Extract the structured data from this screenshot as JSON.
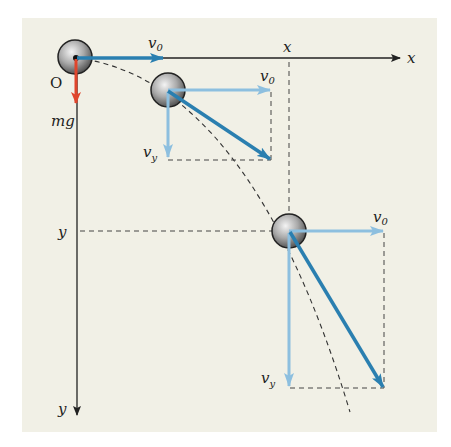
{
  "figure": {
    "type": "projectile-motion-diagram",
    "background_color": "#f1f0e6",
    "colors": {
      "velocity_dark": "#2a7fb0",
      "velocity_light": "#8dbfdf",
      "gravity": "#e0452c",
      "axis": "#222222",
      "trajectory": "#333333"
    },
    "labels": {
      "origin": "O",
      "x_axis": "x",
      "y_axis": "y",
      "x_marker": "x",
      "y_marker": "y",
      "gravity": "mg",
      "v0_main": "v",
      "v0_main_sub": "0",
      "v0_ball2": "v",
      "v0_ball2_sub": "0",
      "vy_ball2": "v",
      "vy_ball2_sub": "y",
      "v0_ball3": "v",
      "v0_ball3_sub": "0",
      "vy_ball3": "v",
      "vy_ball3_sub": "y"
    },
    "balls": [
      {
        "name": "ball-origin",
        "cx": 75,
        "cy": 57
      },
      {
        "name": "ball-2",
        "cx": 168,
        "cy": 90
      },
      {
        "name": "ball-3",
        "cx": 289,
        "cy": 231
      }
    ]
  }
}
